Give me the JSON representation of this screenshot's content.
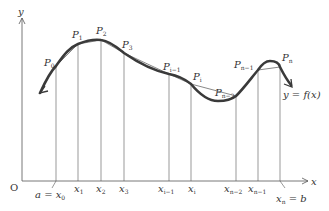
{
  "axes": {
    "x_label": "x",
    "y_label": "y",
    "origin_label": "O"
  },
  "function_label": "y = f(x)",
  "points": [
    {
      "name": "P",
      "sub": "0"
    },
    {
      "name": "P",
      "sub": "1"
    },
    {
      "name": "P",
      "sub": "2"
    },
    {
      "name": "P",
      "sub": "3"
    },
    {
      "name": "P",
      "sub": "i−1"
    },
    {
      "name": "P",
      "sub": "i"
    },
    {
      "name": "P",
      "sub": "n−2"
    },
    {
      "name": "P",
      "sub": "n−1"
    },
    {
      "name": "P",
      "sub": "n"
    }
  ],
  "ticks": [
    {
      "name": "x",
      "sub": "0",
      "prefix": "a = "
    },
    {
      "name": "x",
      "sub": "1"
    },
    {
      "name": "x",
      "sub": "2"
    },
    {
      "name": "x",
      "sub": "3"
    },
    {
      "name": "x",
      "sub": "i−1"
    },
    {
      "name": "x",
      "sub": "i"
    },
    {
      "name": "x",
      "sub": "n−2"
    },
    {
      "name": "x",
      "sub": "n−1"
    },
    {
      "name": "x",
      "sub": "n",
      "suffix": " = b"
    }
  ],
  "colors": {
    "curve": "#3a3a3a",
    "lines": "#555555",
    "text": "#333333"
  }
}
